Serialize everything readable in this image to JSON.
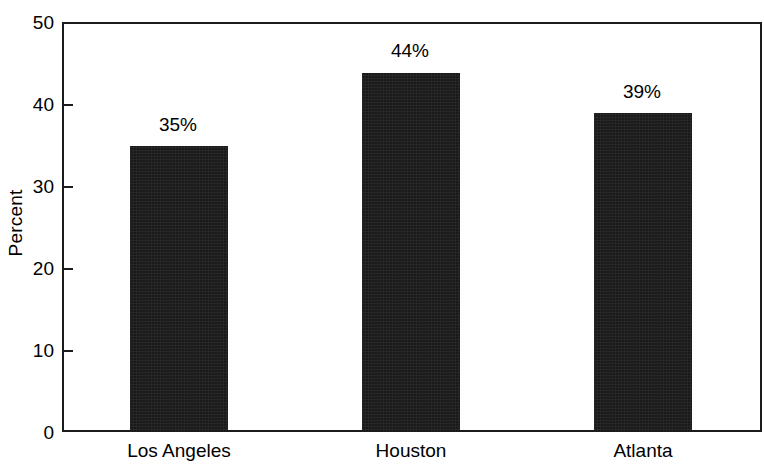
{
  "chart_data": {
    "type": "bar",
    "title": "",
    "subtitle": "",
    "xlabel": "",
    "ylabel": "Percent",
    "categories": [
      "Los Angeles",
      "Houston",
      "Atlanta"
    ],
    "values": [
      35,
      44,
      39
    ],
    "data_labels": [
      "35%",
      "44%",
      "39%"
    ],
    "ylim": [
      0,
      50
    ],
    "ytick_values": [
      0,
      10,
      20,
      30,
      40,
      50
    ],
    "ytick_labels": [
      "0",
      "10",
      "20",
      "30",
      "40",
      "50"
    ],
    "grid": false,
    "legend": false,
    "legend_position": "none",
    "series": [
      {
        "name": "Percent",
        "values": [
          35,
          44,
          39
        ],
        "color": "#1a1a1a"
      }
    ]
  },
  "colors": {
    "bar": "#1a1a1a",
    "axis": "#1c1c1c",
    "text": "#000000",
    "background": "#ffffff"
  }
}
